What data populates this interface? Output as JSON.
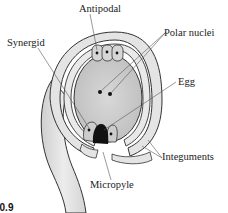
{
  "diagram": {
    "figure_label": "20.9",
    "labels": {
      "antipodal": "Antipodal",
      "polar_nuclei": "Polar nuclei",
      "synergid": "Synergid",
      "egg": "Egg",
      "integuments": "Integuments",
      "micropyle": "Micropyle"
    },
    "colors": {
      "outline": "#333333",
      "integument_fill": "#e2e2e2",
      "sac_fill": "#cfcfcf",
      "egg_fill": "#111111",
      "leader_line": "#555555"
    }
  }
}
